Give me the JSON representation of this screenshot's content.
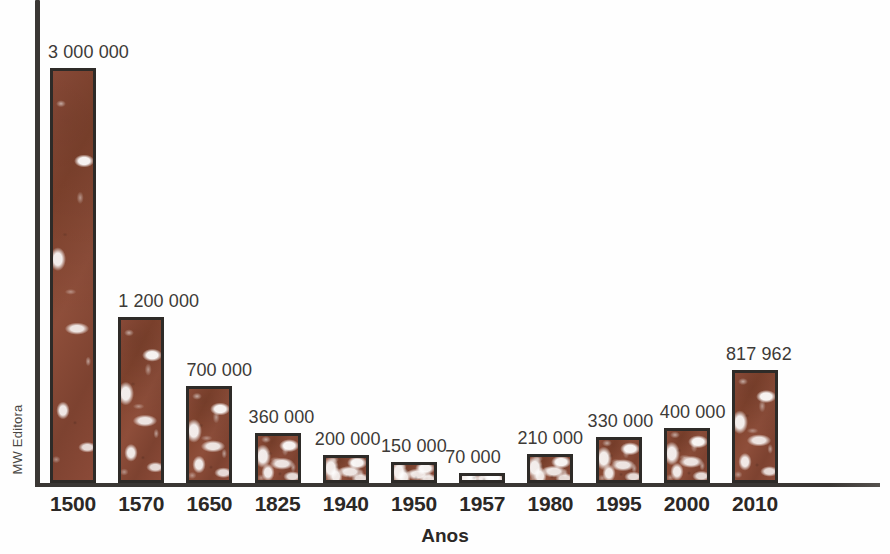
{
  "chart_data": {
    "type": "bar",
    "title": "",
    "xlabel": "Anos",
    "ylabel": "",
    "categories": [
      "1500",
      "1570",
      "1650",
      "1825",
      "1940",
      "1950",
      "1957",
      "1980",
      "1995",
      "2000",
      "2010"
    ],
    "values": [
      3000000,
      1200000,
      700000,
      360000,
      200000,
      150000,
      70000,
      210000,
      330000,
      400000,
      817962
    ],
    "value_labels": [
      "3 000 000",
      "1 200 000",
      "700 000",
      "360 000",
      "200 000",
      "150 000",
      "70 000",
      "210 000",
      "330 000",
      "400 000",
      "817 962"
    ],
    "ylim": [
      0,
      3000000
    ],
    "grid": false,
    "legend": null,
    "series": [
      {
        "name": "",
        "values": [
          3000000,
          1200000,
          700000,
          360000,
          200000,
          150000,
          70000,
          210000,
          330000,
          400000,
          817962
        ]
      }
    ],
    "bar_color": "#8b4a38",
    "bar_outline_color": "#2e2b28",
    "axis_color": "#3a3734"
  },
  "axes": {
    "x_title": "Anos",
    "y_credit": "MW Editora"
  },
  "colors": {
    "bar_fill": "#8b4a38",
    "bar_stroke": "#2e2b28",
    "axis": "#3a3734",
    "label_text": "#3d3a37",
    "tick_text": "#2b2826",
    "background": "#fefefe"
  }
}
